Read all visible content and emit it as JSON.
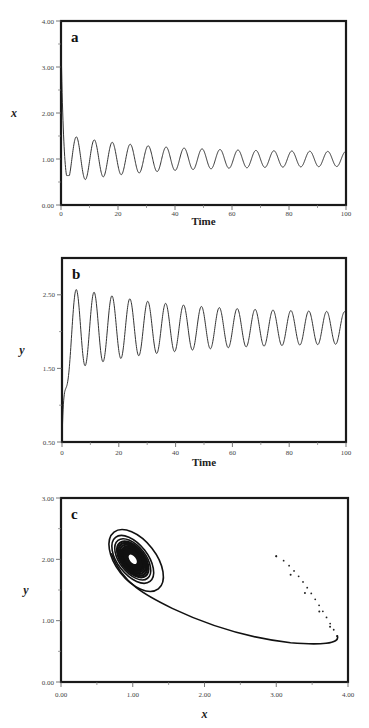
{
  "chart_data": [
    {
      "id": "a",
      "type": "line",
      "panel_label": "a",
      "title": "",
      "xlabel": "Time",
      "ylabel": "x",
      "xlim": [
        0,
        100
      ],
      "ylim": [
        0,
        4
      ],
      "xticks": [
        0,
        20,
        40,
        60,
        80,
        100
      ],
      "xtick_labels": [
        "0",
        "20",
        "40",
        "60",
        "80",
        "100"
      ],
      "yticks": [
        0,
        1,
        2,
        3,
        4
      ],
      "ytick_labels": [
        "0.00",
        "1.00",
        "2.00",
        "3.00",
        "4.00"
      ],
      "grid": false,
      "description": "Damped oscillation of x over time: starts at ~3.6, drops to ~0.65 near t=3, then oscillates with period ~6.3 and decaying amplitude around ~1.0",
      "series": [
        {
          "name": "x(t)",
          "x": [
            0,
            1,
            2,
            3,
            5,
            7,
            9,
            11,
            13,
            16,
            19,
            22,
            25,
            32,
            38,
            44,
            50,
            60,
            70,
            80,
            90,
            100
          ],
          "y": [
            3.6,
            1.6,
            0.8,
            0.65,
            0.9,
            1.52,
            0.95,
            0.78,
            1.38,
            0.8,
            1.3,
            0.82,
            1.25,
            1.2,
            1.18,
            1.15,
            1.15,
            1.13,
            1.13,
            1.12,
            1.12,
            1.0
          ]
        }
      ],
      "envelope": {
        "peak_first": 1.52,
        "trough_first": 0.65,
        "steady_center": 1.0,
        "steady_amplitude": 0.15,
        "period": 6.3
      }
    },
    {
      "id": "b",
      "type": "line",
      "panel_label": "b",
      "title": "",
      "xlabel": "Time",
      "ylabel": "y",
      "xlim": [
        0,
        100
      ],
      "ylim": [
        0.5,
        3.0
      ],
      "xticks": [
        0,
        20,
        40,
        60,
        80,
        100
      ],
      "xtick_labels": [
        "0",
        "20",
        "40",
        "60",
        "80",
        "100"
      ],
      "yticks": [
        0.5,
        1.5,
        2.5
      ],
      "ytick_labels": [
        "0.50",
        "1.50",
        "2.50"
      ],
      "grid": false,
      "description": "Damped oscillation of y over time: starts at 0.5, rises to ~2.55 at t~5, then oscillates with period ~6.3 around ~2.0 with decaying amplitude",
      "series": [
        {
          "name": "y(t)",
          "x": [
            0,
            5,
            8,
            11,
            14,
            17,
            20,
            30,
            40,
            50,
            60,
            70,
            80,
            90,
            100
          ],
          "y": [
            0.5,
            2.55,
            1.45,
            2.4,
            1.6,
            2.32,
            1.67,
            2.25,
            2.22,
            2.2,
            2.2,
            2.18,
            2.18,
            2.17,
            2.15
          ]
        }
      ],
      "envelope": {
        "peak_first": 2.55,
        "trough_first": 1.45,
        "steady_center": 2.0,
        "steady_amplitude": 0.2,
        "period": 6.3
      }
    },
    {
      "id": "c",
      "type": "scatter",
      "panel_label": "c",
      "title": "",
      "xlabel": "x",
      "ylabel": "y",
      "xlim": [
        0,
        4
      ],
      "ylim": [
        0,
        3
      ],
      "xticks": [
        0,
        1,
        2,
        3,
        4
      ],
      "xtick_labels": [
        "0.00",
        "1.00",
        "2.00",
        "3.00",
        "4.00"
      ],
      "yticks": [
        0,
        1,
        2,
        3
      ],
      "ytick_labels": [
        "0.00",
        "1.00",
        "2.00",
        "3.00"
      ],
      "grid": false,
      "description": "Phase portrait: trajectory starts at (3.0, 2.05), moves down to ~(3.85, 0.75), sweeps left along lower curve through (2.0, 0.95) and (1.4, 1.3), then spirals inward toward the fixed point near (1.0, 2.0)",
      "series": [
        {
          "name": "trajectory",
          "x": [
            3.0,
            3.2,
            3.4,
            3.6,
            3.75,
            3.85,
            3.8,
            3.5,
            3.0,
            2.5,
            2.0,
            1.6,
            1.4,
            1.2,
            0.9,
            0.65,
            0.7,
            1.0,
            1.3,
            1.4
          ],
          "y": [
            2.05,
            1.75,
            1.45,
            1.15,
            0.9,
            0.75,
            0.67,
            0.62,
            0.68,
            0.82,
            0.98,
            1.15,
            1.3,
            1.45,
            1.7,
            2.2,
            2.55,
            2.35,
            1.85,
            1.5
          ]
        },
        {
          "name": "fixed-point",
          "x": [
            1.0
          ],
          "y": [
            2.0
          ]
        }
      ],
      "fixed_point": [
        1.0,
        2.0
      ]
    }
  ]
}
